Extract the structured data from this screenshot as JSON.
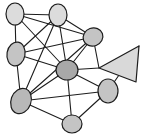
{
  "figure": {
    "width": 149,
    "height": 139,
    "background": "#ffffff"
  },
  "style": {
    "edge_color": "#1d1d1d",
    "edge_width": 1.1,
    "node_stroke": "#1d1d1d",
    "node_stroke_width": 1.2,
    "arrow_fill": "#d9d9d9",
    "arrow_stroke": "#1d1d1d",
    "fill_light": "#dcdcdc",
    "fill_mid": "#c4c4c4",
    "fill_dark": "#a8a8a8"
  },
  "chart_data": {
    "type": "scatter",
    "title": "",
    "xlabel": "",
    "ylabel": "",
    "grid": false,
    "legend": "none",
    "nodes": [
      {
        "id": "n1",
        "label": "",
        "x": 15,
        "y": 14,
        "rx": 9,
        "ry": 11,
        "rotation": 0,
        "fill": "#dcdcdc"
      },
      {
        "id": "n2",
        "label": "",
        "x": 58,
        "y": 15,
        "rx": 9,
        "ry": 11,
        "rotation": 0,
        "fill": "#dcdcdc"
      },
      {
        "id": "n3",
        "label": "",
        "x": 93,
        "y": 37,
        "rx": 10,
        "ry": 9,
        "rotation": -20,
        "fill": "#c4c4c4"
      },
      {
        "id": "n4",
        "label": "",
        "x": 16,
        "y": 54,
        "rx": 9,
        "ry": 12,
        "rotation": 10,
        "fill": "#c4c4c4"
      },
      {
        "id": "n5",
        "label": "",
        "x": 67,
        "y": 70,
        "rx": 11,
        "ry": 10,
        "rotation": 0,
        "fill": "#a8a8a8"
      },
      {
        "id": "n6",
        "label": "",
        "x": 108,
        "y": 91,
        "rx": 10,
        "ry": 12,
        "rotation": 0,
        "fill": "#c4c4c4"
      },
      {
        "id": "n7",
        "label": "",
        "x": 21,
        "y": 101,
        "rx": 10,
        "ry": 13,
        "rotation": 20,
        "fill": "#b8b8b8"
      },
      {
        "id": "n8",
        "label": "",
        "x": 72,
        "y": 124,
        "rx": 10,
        "ry": 9,
        "rotation": 0,
        "fill": "#c4c4c4"
      }
    ],
    "edges": [
      {
        "source": "n1",
        "target": "n2"
      },
      {
        "source": "n1",
        "target": "n4"
      },
      {
        "source": "n1",
        "target": "n5"
      },
      {
        "source": "n1",
        "target": "n3"
      },
      {
        "source": "n2",
        "target": "n3"
      },
      {
        "source": "n2",
        "target": "n4"
      },
      {
        "source": "n2",
        "target": "n5"
      },
      {
        "source": "n2",
        "target": "n7"
      },
      {
        "source": "n3",
        "target": "n4"
      },
      {
        "source": "n3",
        "target": "n5"
      },
      {
        "source": "n4",
        "target": "n7"
      },
      {
        "source": "n4",
        "target": "n5"
      },
      {
        "source": "n5",
        "target": "n7"
      },
      {
        "source": "n5",
        "target": "n8"
      },
      {
        "source": "n5",
        "target": "n6"
      },
      {
        "source": "n6",
        "target": "n7"
      },
      {
        "source": "n6",
        "target": "n8"
      },
      {
        "source": "n7",
        "target": "n8"
      },
      {
        "source": "n7",
        "target": "n3"
      },
      {
        "source": "n3",
        "target": "arrow_apex"
      },
      {
        "source": "n5",
        "target": "arrow_apex"
      },
      {
        "source": "n6",
        "target": "arrow_base_top"
      }
    ],
    "arrow_marker": {
      "id": "arrow",
      "label": "",
      "apex": {
        "x": 99,
        "y": 68
      },
      "base_top": {
        "x": 139,
        "y": 46
      },
      "base_bottom": {
        "x": 136,
        "y": 82
      },
      "direction": "left",
      "fill": "#d9d9d9"
    }
  }
}
